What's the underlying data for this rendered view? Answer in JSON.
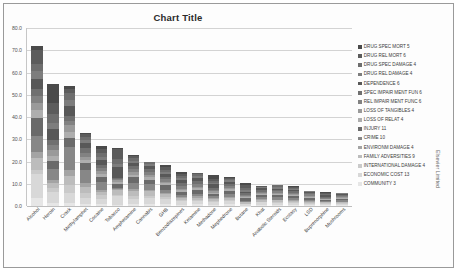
{
  "figure": {
    "credit": "Elsevier Limited"
  },
  "chart_data": {
    "type": "bar",
    "subtype": "stacked-column",
    "title": "Chart Title",
    "xlabel": "",
    "ylabel": "",
    "ylim": [
      0,
      80
    ],
    "yticks": [
      "0.0",
      "10.0",
      "20.0",
      "30.0",
      "40.0",
      "50.0",
      "60.0",
      "70.0",
      "80.0"
    ],
    "ytick_values": [
      0,
      10,
      20,
      30,
      40,
      50,
      60,
      70,
      80
    ],
    "grid": true,
    "legend_position": "right",
    "categories": [
      "Alcohol",
      "Heroin",
      "Crack",
      "Methylamphet",
      "Cocaine",
      "Tobacco",
      "Amphetamine",
      "Cannabis",
      "GHB",
      "Benzodiazepines",
      "Ketamine",
      "Methadone",
      "Mephedrone",
      "Butane",
      "Khat",
      "Anabolic Steroids",
      "Ecstasy",
      "LSD",
      "Buprenorphine",
      "Mushrooms"
    ],
    "totals": [
      72,
      55,
      54,
      33,
      27,
      26,
      23,
      20,
      18.5,
      15.5,
      15,
      14,
      13,
      10.5,
      9,
      9.5,
      9,
      7,
      6.5,
      6
    ],
    "series": [
      {
        "name": "DRUG SPEC MORT 5",
        "color": "#4a4a4a",
        "values": [
          2,
          10,
          1.5,
          0.8,
          1.5,
          0.5,
          0.5,
          0,
          1.0,
          1.0,
          0,
          2.0,
          0.3,
          1.0,
          0,
          0,
          0.3,
          0,
          0.6,
          0
        ]
      },
      {
        "name": "DRUG REL MORT 6",
        "color": "#5c5c5c",
        "values": [
          6,
          6,
          2.0,
          1.0,
          2.0,
          4.5,
          1.0,
          0.3,
          1.2,
          1.0,
          0.5,
          1.2,
          0.5,
          1.5,
          0.2,
          0.2,
          0.5,
          0,
          0.4,
          0
        ]
      },
      {
        "name": "DRUG SPEC DAMAGE 4",
        "color": "#6e6e6e",
        "values": [
          3.5,
          4.5,
          3.5,
          1.5,
          2.0,
          2.0,
          1.2,
          0.8,
          1.0,
          1.2,
          1.0,
          0.8,
          0.6,
          0.8,
          0.3,
          0.8,
          0.5,
          0.3,
          0.3,
          0.3
        ]
      },
      {
        "name": "DRUG REL DAMAGE 4",
        "color": "#7d7d7d",
        "values": [
          3.5,
          3.5,
          2.5,
          1.2,
          1.5,
          1.5,
          1.0,
          0.8,
          0.9,
          0.8,
          0.9,
          0.7,
          0.6,
          0.7,
          0.3,
          0.6,
          0.5,
          0.3,
          0.3,
          0.3
        ]
      },
      {
        "name": "DEPENDENCE 6",
        "color": "#585858",
        "values": [
          4.5,
          5.5,
          5.0,
          2.5,
          2.5,
          5.0,
          1.5,
          1.5,
          1.2,
          1.5,
          1.2,
          1.5,
          1.0,
          0.8,
          1.0,
          0.8,
          0.6,
          0.2,
          0.8,
          0.2
        ]
      },
      {
        "name": "SPEC IMPAIR MENT FUN 6",
        "color": "#707070",
        "values": [
          3.0,
          3.0,
          2.5,
          2.0,
          1.5,
          0.5,
          1.5,
          1.5,
          1.2,
          1.5,
          1.5,
          1.0,
          0.9,
          0.7,
          0.7,
          0.5,
          0.6,
          0.7,
          0.4,
          0.6
        ]
      },
      {
        "name": "REL IMPAIR MENT FUNC 6",
        "color": "#828282",
        "values": [
          3.0,
          2.5,
          2.0,
          1.8,
          1.2,
          0.5,
          1.2,
          1.2,
          1.0,
          1.2,
          1.2,
          0.8,
          0.8,
          0.6,
          0.6,
          0.5,
          0.5,
          0.5,
          0.3,
          0.5
        ]
      },
      {
        "name": "LOSS OF TANGIBLES 4",
        "color": "#9a9a9a",
        "values": [
          3.5,
          3.0,
          3.0,
          1.5,
          1.5,
          1.0,
          1.2,
          1.0,
          0.8,
          0.8,
          0.8,
          0.7,
          0.7,
          0.5,
          0.5,
          0.5,
          0.5,
          0.4,
          0.3,
          0.4
        ]
      },
      {
        "name": "LOSS OF RELAT 4",
        "color": "#aeaeae",
        "values": [
          3.5,
          3.0,
          3.0,
          1.5,
          1.5,
          1.0,
          1.2,
          1.0,
          0.8,
          0.8,
          0.8,
          0.7,
          0.7,
          0.5,
          0.5,
          0.5,
          0.5,
          0.4,
          0.3,
          0.4
        ]
      },
      {
        "name": "INJURY 11",
        "color": "#6a6a6a",
        "values": [
          8.0,
          4.0,
          4.5,
          3.0,
          2.5,
          1.5,
          2.5,
          2.0,
          2.0,
          1.5,
          1.8,
          1.2,
          1.5,
          1.0,
          1.0,
          1.2,
          1.0,
          0.8,
          0.6,
          0.8
        ]
      },
      {
        "name": "CRIME 10",
        "color": "#878787",
        "values": [
          7.0,
          6.0,
          11.0,
          6.0,
          4.0,
          0.5,
          3.0,
          2.5,
          1.5,
          1.0,
          1.0,
          1.0,
          1.2,
          0.5,
          0.8,
          1.0,
          0.8,
          0.5,
          0.4,
          0.5
        ]
      },
      {
        "name": "ENVIRONM DAMAGE 4",
        "color": "#a4a4a4",
        "values": [
          3.0,
          1.5,
          3.0,
          1.5,
          1.0,
          0.5,
          1.0,
          0.8,
          0.6,
          0.5,
          0.5,
          0.4,
          0.5,
          0.3,
          0.4,
          0.4,
          0.4,
          0.3,
          0.2,
          0.3
        ]
      },
      {
        "name": "FAMILY ADVERSITIES 9",
        "color": "#bcbcbc",
        "values": [
          5.5,
          2.5,
          4.5,
          3.0,
          1.5,
          2.5,
          2.0,
          2.0,
          1.3,
          1.0,
          1.0,
          0.8,
          1.0,
          0.5,
          0.7,
          0.7,
          0.6,
          0.5,
          0.4,
          0.5
        ]
      },
      {
        "name": "INTERNATIONAL DAMAGE 4",
        "color": "#cacaca",
        "values": [
          1.5,
          2.0,
          3.5,
          2.0,
          2.0,
          0.5,
          1.5,
          1.2,
          0.8,
          0.5,
          0.5,
          0.4,
          0.5,
          0.3,
          0.4,
          0.4,
          0.3,
          0.3,
          0.2,
          0.3
        ]
      },
      {
        "name": "ECONOMIC COST 13",
        "color": "#d8d8d8",
        "values": [
          11.0,
          6.0,
          5.0,
          3.0,
          2.5,
          4.0,
          2.5,
          2.5,
          2.5,
          1.5,
          1.5,
          1.5,
          1.5,
          0.6,
          1.0,
          0.8,
          0.8,
          0.6,
          0.5,
          0.6
        ]
      },
      {
        "name": "COMMUNITY 3",
        "color": "#e6e6e6",
        "values": [
          3.5,
          1.5,
          1.5,
          0.7,
          0.8,
          0.5,
          0.7,
          0.9,
          0.7,
          0.7,
          0.8,
          0.6,
          0.7,
          0.2,
          0.6,
          0.6,
          0.6,
          0.2,
          0.5,
          0.3
        ]
      }
    ]
  }
}
